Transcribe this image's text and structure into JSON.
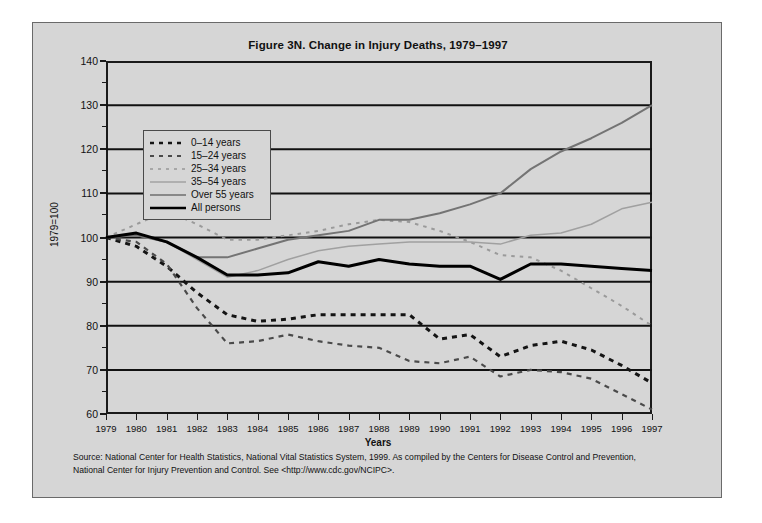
{
  "figure": {
    "title": "Figure 3N. Change in Injury Deaths, 1979–1997",
    "ylabel": "1979=100",
    "xlabel": "Years",
    "source_line1": "Source: National Center for Health Statistics, National Vital Statistics System, 1999.  As compiled by the Centers for Disease Control and Prevention,",
    "source_line2": "National Center for Injury Prevention and Control.  See <http://www.cdc.gov/NCIPC>."
  },
  "colors": {
    "page_background": "#ffffff",
    "figure_background": "#d6d6d6",
    "frame_border": "#6a6a6a",
    "axis": "#1a1a1a",
    "gridline": "#111111",
    "series_0_14": "#141414",
    "series_15_24": "#3d3d3d",
    "series_25_34": "#8d8d8d",
    "series_35_54": "#9a9a9a",
    "series_over_55": "#8a8a8a",
    "series_all_persons": "#000000"
  },
  "legend": {
    "entries": [
      {
        "label": "0–14 years",
        "style": "dashed-heavy",
        "color": "#141414"
      },
      {
        "label": "15–24 years",
        "style": "dashed-medium",
        "color": "#3d3d3d"
      },
      {
        "label": "25–34 years",
        "style": "dotted-light",
        "color": "#8d8d8d"
      },
      {
        "label": "35–54 years",
        "style": "solid-thin",
        "color": "#9a9a9a"
      },
      {
        "label": "Over 55 years",
        "style": "solid-medium",
        "color": "#8a8a8a"
      },
      {
        "label": "All persons",
        "style": "solid-heavy",
        "color": "#000000"
      }
    ]
  },
  "chart_data": {
    "type": "line",
    "title": "Figure 3N. Change in Injury Deaths, 1979–1997",
    "xlabel": "Years",
    "ylabel": "1979=100",
    "grid": true,
    "legend_position": "upper-left-inside",
    "xlim": [
      1979,
      1997
    ],
    "ylim": [
      60,
      140
    ],
    "yticks": [
      60,
      70,
      80,
      90,
      100,
      110,
      120,
      130,
      140
    ],
    "x": [
      1979,
      1980,
      1981,
      1982,
      1983,
      1984,
      1985,
      1986,
      1987,
      1988,
      1989,
      1990,
      1991,
      1992,
      1993,
      1994,
      1995,
      1996,
      1997
    ],
    "categories": [
      "1979",
      "1980",
      "1981",
      "1982",
      "1983",
      "1984",
      "1985",
      "1986",
      "1987",
      "1988",
      "1989",
      "1990",
      "1991",
      "1992",
      "1993",
      "1994",
      "1995",
      "1996",
      "1997"
    ],
    "series": [
      {
        "name": "0–14 years",
        "style": "dashed-heavy",
        "color": "#141414",
        "values": [
          100.0,
          98.0,
          93.5,
          87.5,
          82.5,
          81.0,
          81.5,
          82.5,
          82.5,
          82.5,
          82.5,
          77.0,
          78.0,
          73.0,
          75.5,
          76.5,
          74.5,
          71.0,
          67.0
        ]
      },
      {
        "name": "15–24 years",
        "style": "dashed-medium",
        "color": "#3d3d3d",
        "values": [
          100.0,
          99.0,
          94.0,
          84.0,
          76.0,
          76.5,
          78.0,
          76.5,
          75.5,
          75.0,
          72.0,
          71.5,
          73.0,
          68.5,
          70.0,
          69.5,
          68.0,
          64.5,
          61.0
        ]
      },
      {
        "name": "25–34 years",
        "style": "dotted-light",
        "color": "#8d8d8d",
        "values": [
          100.0,
          103.0,
          106.0,
          103.0,
          99.5,
          99.5,
          100.5,
          101.5,
          103.0,
          104.0,
          103.5,
          101.5,
          99.0,
          96.0,
          95.5,
          92.5,
          88.5,
          84.5,
          80.0
        ]
      },
      {
        "name": "35–54 years",
        "style": "solid-thin",
        "color": "#9a9a9a",
        "values": [
          100.0,
          100.5,
          99.0,
          95.0,
          91.0,
          92.5,
          95.0,
          97.0,
          98.0,
          98.5,
          99.0,
          99.0,
          99.0,
          98.5,
          100.5,
          101.0,
          103.0,
          106.5,
          108.0
        ]
      },
      {
        "name": "Over 55 years",
        "style": "solid-medium",
        "color": "#8a8a8a",
        "values": [
          100.0,
          100.5,
          99.0,
          95.5,
          95.5,
          97.5,
          99.5,
          100.5,
          101.5,
          104.0,
          104.0,
          105.5,
          107.5,
          110.0,
          115.5,
          119.5,
          122.5,
          126.0,
          130.0
        ]
      },
      {
        "name": "All persons",
        "style": "solid-heavy",
        "color": "#000000",
        "values": [
          100.0,
          101.0,
          99.0,
          95.5,
          91.5,
          91.5,
          92.0,
          94.5,
          93.5,
          95.0,
          94.0,
          93.5,
          93.5,
          90.5,
          94.0,
          94.0,
          93.5,
          93.0,
          92.5
        ]
      }
    ]
  }
}
